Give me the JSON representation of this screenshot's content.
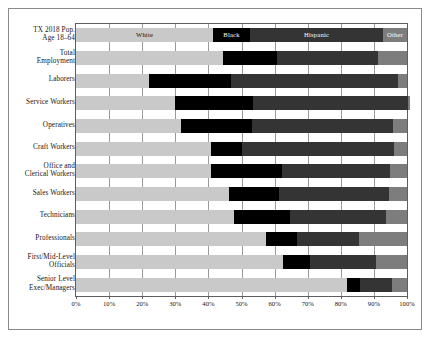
{
  "chart_data": {
    "type": "bar",
    "subtype": "stacked-horizontal-100pct",
    "title": "",
    "xlabel": "",
    "ylabel": "",
    "xlim": [
      0,
      100
    ],
    "xticks": [
      "0%",
      "10%",
      "20%",
      "30%",
      "40%",
      "50%",
      "60%",
      "70%",
      "80%",
      "90%",
      "100%"
    ],
    "grid": true,
    "legend_position": "in-first-bar",
    "legend": [
      "White",
      "Black",
      "Hispanic",
      "Other"
    ],
    "colors": {
      "White": "#c9c9c9",
      "Black": "#000000",
      "Hispanic": "#343434",
      "Other": "#7d7d7d"
    },
    "categories": [
      "TX 2018 Pop.\nAge 18–64",
      "Total\nEmployment",
      "Laborers",
      "Service Workers",
      "Operatives",
      "Craft Workers",
      "Office and\nClerical Workers",
      "Sales Workers",
      "Technicians",
      "Professionals",
      "First/Mid-Level\nOfficials",
      "Senior Level\nExec/Managers"
    ],
    "series": [
      {
        "name": "White",
        "values": [
          41.4,
          44.4,
          22.0,
          29.9,
          31.7,
          40.8,
          40.8,
          46.2,
          47.7,
          57.4,
          62.5,
          81.9
        ]
      },
      {
        "name": "Black",
        "values": [
          11.2,
          16.3,
          24.8,
          23.6,
          21.5,
          9.4,
          21.4,
          15.1,
          17.0,
          9.4,
          8.2,
          3.9
        ]
      },
      {
        "name": "Hispanic",
        "values": [
          40.2,
          30.5,
          50.5,
          46.8,
          42.6,
          45.9,
          32.6,
          33.2,
          28.9,
          18.7,
          19.9,
          9.7
        ]
      },
      {
        "name": "Other",
        "values": [
          7.2,
          8.8,
          2.7,
          0.7,
          4.2,
          3.9,
          5.2,
          5.5,
          6.4,
          14.5,
          9.4,
          4.5
        ]
      }
    ]
  }
}
